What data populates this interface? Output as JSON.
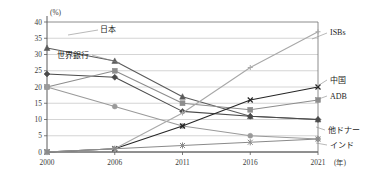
{
  "chart_data": {
    "type": "line",
    "title": "",
    "subtitle": "",
    "xlabel": "(年)",
    "ylabel": "(%)",
    "unit_top_left": "(%)",
    "unit_bottom_right": "(年)",
    "categories": [
      "2000",
      "2006",
      "2011",
      "2016",
      "2021"
    ],
    "x_tick_labels": [
      "2000",
      "2006",
      "2011",
      "2016",
      "2021"
    ],
    "y_tick_labels": [
      "0",
      "5",
      "10",
      "15",
      "20",
      "25",
      "30",
      "35",
      "40"
    ],
    "y_ticks": [
      0,
      5,
      10,
      15,
      20,
      25,
      30,
      35,
      40
    ],
    "ylim": [
      0,
      40
    ],
    "grid": true,
    "legend_position": "inline-labels",
    "series": [
      {
        "name": "日本",
        "label": "日本",
        "label_side": "left",
        "marker": "triangle",
        "color": "#5a5a5a",
        "values": [
          32,
          28,
          17,
          11,
          10
        ]
      },
      {
        "name": "世界銀行",
        "label": "世界銀行",
        "label_side": "left",
        "marker": "diamond",
        "color": "#4a4a4a",
        "values": [
          24,
          23,
          12.5,
          11,
          10
        ]
      },
      {
        "name": "ADB",
        "label": "ADB",
        "label_side": "right",
        "marker": "square",
        "color": "#8d8d8d",
        "values": [
          20,
          25,
          15,
          13,
          16
        ]
      },
      {
        "name": "他ドナー",
        "label": "他ドナー",
        "label_side": "right",
        "marker": "circle",
        "color": "#9a9a9a",
        "values": [
          20,
          14,
          8,
          5,
          4
        ]
      },
      {
        "name": "中国",
        "label": "中国",
        "label_side": "right",
        "marker": "cross",
        "color": "#262626",
        "values": [
          0,
          1,
          8,
          16,
          20
        ]
      },
      {
        "name": "ISBs",
        "label": "ISBs",
        "label_side": "right",
        "marker": "plus",
        "color": "#a8a8a8",
        "values": [
          0,
          1,
          12,
          26,
          37
        ]
      },
      {
        "name": "インド",
        "label": "インド",
        "label_side": "right",
        "marker": "star",
        "color": "#8a8a8a",
        "values": [
          0,
          1,
          2,
          3,
          4
        ]
      }
    ]
  }
}
